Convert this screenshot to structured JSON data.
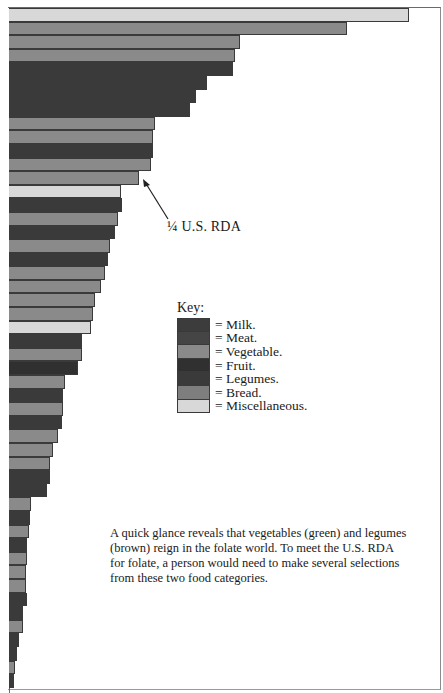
{
  "chart_data": {
    "type": "bar",
    "orientation": "horizontal",
    "title": "",
    "xlabel": "",
    "ylabel": "",
    "xlim": [
      0,
      100
    ],
    "grid": false,
    "legend_position": "right-middle",
    "note": "Relative folate content per food item; top bar normalized to 100. No tick labels shown.",
    "categories": [
      "1",
      "2",
      "3",
      "4",
      "5",
      "6",
      "7",
      "8",
      "9",
      "10",
      "11",
      "12",
      "13",
      "14",
      "15",
      "16",
      "17",
      "18",
      "19",
      "20",
      "21",
      "22",
      "23",
      "24",
      "25",
      "26",
      "27",
      "28",
      "29",
      "30",
      "31",
      "32",
      "33",
      "34",
      "35",
      "36",
      "37",
      "38",
      "39",
      "40",
      "41",
      "42",
      "43",
      "44",
      "45",
      "46",
      "47",
      "48",
      "49",
      "50"
    ],
    "values": [
      100,
      84.5,
      57.75,
      56.5,
      56,
      49.5,
      46.75,
      45.25,
      36.5,
      36,
      36,
      35.5,
      32.5,
      28,
      28.25,
      27.25,
      26.5,
      25.25,
      24.75,
      24,
      23,
      21.5,
      21,
      20.5,
      18.25,
      18.25,
      17.25,
      14,
      13.5,
      13.5,
      13.25,
      12.25,
      11,
      10.25,
      10.25,
      9.5,
      5.5,
      5.25,
      5,
      4.5,
      4.5,
      4.25,
      4.25,
      4.5,
      3.5,
      3.5,
      2.5,
      2,
      1.5,
      1.25
    ],
    "groups": [
      "Miscellaneous",
      "Vegetable",
      "Vegetable",
      "Vegetable",
      "Legumes",
      "Legumes",
      "Legumes",
      "Legumes",
      "Vegetable",
      "Vegetable",
      "Legumes",
      "Vegetable",
      "Vegetable",
      "Miscellaneous",
      "Legumes",
      "Vegetable",
      "Legumes",
      "Vegetable",
      "Legumes",
      "Vegetable",
      "Vegetable",
      "Vegetable",
      "Vegetable",
      "Miscellaneous",
      "Legumes",
      "Vegetable",
      "Fruit",
      "Vegetable",
      "Legumes",
      "Vegetable",
      "Legumes",
      "Vegetable",
      "Vegetable",
      "Vegetable",
      "Legumes",
      "Legumes",
      "Vegetable",
      "Legumes",
      "Vegetable",
      "Legumes",
      "Vegetable",
      "Vegetable",
      "Vegetable",
      "Legumes",
      "Legumes",
      "Vegetable",
      "Legumes",
      "Legumes",
      "Vegetable",
      "Legumes"
    ],
    "reference_line": {
      "label": "¼ U.S. RDA",
      "bar_index": 13,
      "value": 32.5
    },
    "legend": [
      {
        "name": "Milk",
        "color": "#3c3c3c"
      },
      {
        "name": "Meat",
        "color": "#454545"
      },
      {
        "name": "Vegetable",
        "color": "#8a8a8a"
      },
      {
        "name": "Fruit",
        "color": "#303030"
      },
      {
        "name": "Legumes",
        "color": "#3a3a3a"
      },
      {
        "name": "Bread",
        "color": "#7e7e7e"
      },
      {
        "name": "Miscellaneous",
        "color": "#d8d8d8"
      }
    ]
  },
  "annotation": {
    "rda_label": "¼ U.S. RDA"
  },
  "key": {
    "title": "Key:",
    "items": [
      {
        "label": "= Milk.",
        "color": "#3c3c3c"
      },
      {
        "label": "= Meat.",
        "color": "#454545"
      },
      {
        "label": "= Vegetable.",
        "color": "#8a8a8a"
      },
      {
        "label": "= Fruit.",
        "color": "#303030"
      },
      {
        "label": "= Legumes.",
        "color": "#3a3a3a"
      },
      {
        "label": "= Bread.",
        "color": "#7e7e7e"
      },
      {
        "label": "= Miscellaneous.",
        "color": "#d8d8d8"
      }
    ]
  },
  "caption": "A quick glance reveals that vegetables (green) and legumes (brown) reign in the folate world. To meet the U.S. RDA for folate, a person would need to make several selections from these two food categories."
}
